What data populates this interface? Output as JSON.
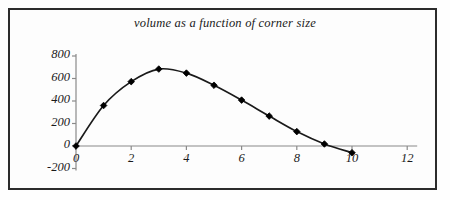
{
  "figure": {
    "title": "volume as a function of corner size",
    "frame_color": "#2c2c2c",
    "background_color": "#fdfdfd",
    "line_color": "#1a1a1a",
    "marker_color": "#000000",
    "axis_color": "#8a8a8a"
  },
  "chart_data": {
    "type": "line",
    "title": "volume as a function of corner size",
    "xlabel": "",
    "ylabel": "",
    "grid": false,
    "legend": null,
    "marker": "diamond",
    "xlim": [
      0,
      12
    ],
    "ylim": [
      -200,
      800
    ],
    "x": [
      0,
      1,
      2,
      3,
      4,
      5,
      6,
      7,
      8,
      9,
      10
    ],
    "values": [
      0,
      360,
      572,
      684,
      648,
      540,
      408,
      266,
      128,
      18,
      -60
    ],
    "series": [
      {
        "name": "volume",
        "x": [
          0,
          1,
          2,
          3,
          4,
          5,
          6,
          7,
          8,
          9,
          10
        ],
        "values": [
          0,
          360,
          572,
          684,
          648,
          540,
          408,
          266,
          128,
          18,
          -60
        ]
      }
    ],
    "xticks": [
      0,
      2,
      4,
      6,
      8,
      10,
      12
    ],
    "xtick_labels": [
      "0",
      "2",
      "4",
      "6",
      "8",
      "10",
      "12"
    ],
    "yticks": [
      -200,
      0,
      200,
      400,
      600,
      800
    ],
    "ytick_labels": [
      "-200",
      "0",
      "200",
      "400",
      "600",
      "800"
    ]
  }
}
